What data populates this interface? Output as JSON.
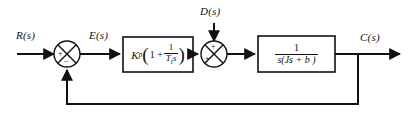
{
  "diagram": {
    "type": "control-block-diagram",
    "width": 408,
    "height": 117,
    "line_color": "#111111",
    "background_color": "#ffffff"
  },
  "signals": {
    "reference": "R(s)",
    "error": "E(s)",
    "disturbance": "D(s)",
    "output": "C(s)"
  },
  "summing_junctions": [
    {
      "id": "error-junction",
      "signs": {
        "left": "+",
        "bottom": "−"
      }
    },
    {
      "id": "disturbance-junction",
      "signs": {
        "top": "+",
        "left": "+"
      }
    }
  ],
  "blocks": [
    {
      "id": "controller",
      "role": "PI controller",
      "gain_symbol": "K",
      "gain_subscript": "p",
      "open_paren": "(",
      "one_plus": "1 +",
      "fraction_numerator": "1",
      "fraction_denominator_symbol": "T",
      "fraction_denominator_subscript": "i",
      "fraction_denominator_var": "s",
      "close_paren": ")",
      "text": "K_p(1 + 1/(T_i s))"
    },
    {
      "id": "plant",
      "role": "Plant / process",
      "fraction_numerator": "1",
      "fraction_denominator": "s(Js + b )",
      "text": "1/(s(Js + b))"
    }
  ],
  "feedback": {
    "type": "unity-feedback",
    "description": "Output fed back to error junction"
  }
}
